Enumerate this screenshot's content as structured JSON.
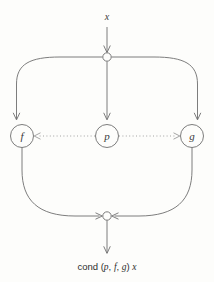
{
  "diagram": {
    "title_alt": "cond combinator dataflow diagram",
    "background_color": "#fdfdfb",
    "line_color": "#6e6e6e",
    "dotted_line_color": "#8d8d8d",
    "text_color": "#3a3a3a",
    "input": {
      "label": "x"
    },
    "output": {
      "label_prefix": "cond",
      "label_open_paren": "(",
      "arg_p": "p",
      "sep_1": ",",
      "arg_f": "f",
      "sep_2": ",",
      "arg_g": "g",
      "label_close_paren": ")",
      "arg_x": "x",
      "full_text": "cond (p, f, g) x"
    },
    "junctions": [
      {
        "id": "top-junction",
        "name": "input-fanout-junction",
        "cx": 107,
        "cy": 57,
        "r": 4.2
      },
      {
        "id": "bottom-junction",
        "name": "output-merge-junction",
        "cx": 107,
        "cy": 216,
        "r": 4.2
      }
    ],
    "nodes": [
      {
        "id": "node-f",
        "label": "f",
        "cx": 22,
        "cy": 136,
        "r": 11.5,
        "name": "function-node-f"
      },
      {
        "id": "node-p",
        "label": "p",
        "cx": 107,
        "cy": 136,
        "r": 11.5,
        "name": "predicate-node-p"
      },
      {
        "id": "node-g",
        "label": "g",
        "cx": 192,
        "cy": 136,
        "r": 11.5,
        "name": "function-node-g"
      }
    ],
    "edges": [
      {
        "id": "edge-input-to-junction",
        "name": "edge-input-to-top-junction",
        "style": "solid",
        "arrow": "down"
      },
      {
        "id": "edge-junction-to-f",
        "name": "edge-top-junction-to-f",
        "style": "solid",
        "arrow": "down"
      },
      {
        "id": "edge-junction-to-p",
        "name": "edge-top-junction-to-p",
        "style": "solid",
        "arrow": "down"
      },
      {
        "id": "edge-junction-to-g",
        "name": "edge-top-junction-to-g",
        "style": "solid",
        "arrow": "down"
      },
      {
        "id": "edge-p-to-f",
        "name": "edge-predicate-control-to-f",
        "style": "dotted",
        "arrow": "left"
      },
      {
        "id": "edge-p-to-g",
        "name": "edge-predicate-control-to-g",
        "style": "dotted",
        "arrow": "right"
      },
      {
        "id": "edge-f-to-merge",
        "name": "edge-f-to-bottom-junction",
        "style": "solid",
        "arrow": "right"
      },
      {
        "id": "edge-g-to-merge",
        "name": "edge-g-to-bottom-junction",
        "style": "solid",
        "arrow": "left"
      },
      {
        "id": "edge-merge-to-output",
        "name": "edge-bottom-junction-to-output",
        "style": "solid",
        "arrow": "down"
      }
    ]
  }
}
